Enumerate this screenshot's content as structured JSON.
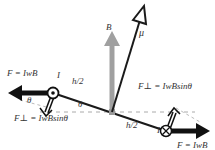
{
  "diagram": {
    "labels": {
      "force_left": "F = IwB",
      "force_right": "F = IwB",
      "fperp_left": "F⊥ = IwBsinθ",
      "fperp_right": "F⊥ = IwBsinθ",
      "current_left": "I",
      "current_right": "I",
      "half_height_left": "h/2",
      "half_height_right": "h/2",
      "theta_left": "θ",
      "theta_center": "θ",
      "field": "B",
      "moment": "μ"
    },
    "colors": {
      "loop": "#1a1a1a",
      "field_arrow": "#a0a0a0",
      "force_arrow": "#111111",
      "dashed": "#aaaaaa",
      "text": "#333333"
    }
  }
}
